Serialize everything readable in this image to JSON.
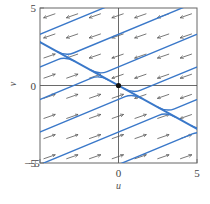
{
  "chart_data": {
    "type": "vector_field",
    "title": "",
    "xlabel": "u",
    "ylabel": "v",
    "xlim": [
      -5,
      5
    ],
    "ylim": [
      -5,
      5
    ],
    "xticks": [
      -5,
      0,
      5
    ],
    "yticks": [
      -5,
      0,
      5
    ],
    "xtick_labels": [
      "−5",
      "0",
      "5"
    ],
    "ytick_labels": [
      "−5",
      "0",
      "5"
    ],
    "grid": false,
    "fixed_point": {
      "u": 0,
      "v": 0
    },
    "separatrix": {
      "slope": -0.56,
      "points": [
        [
          -5,
          3.2
        ],
        [
          0,
          0
        ],
        [
          5,
          -2.35
        ]
      ]
    },
    "field_description": "Arrows point left (with slight down tilt) above the separatrix line and right (with slight up tilt) below it",
    "trajectory_slope": 0.42,
    "trajectory_color": "#3a78c9",
    "arrow_color": "#555555",
    "trajectories_right_of_top": [
      {
        "start": [
          -5,
          4.3
        ],
        "note": "curve from left edge near top bending to separatrix"
      },
      {
        "start": [
          -5,
          1.9
        ]
      },
      {
        "start": [
          -5,
          -0.9
        ]
      },
      {
        "start": [
          -5,
          -2.9
        ]
      },
      {
        "start": [
          -5,
          -5
        ]
      }
    ]
  },
  "axes": {
    "x_label": "u",
    "y_label": "v",
    "x_ticks": [
      "−5",
      "0",
      "5"
    ],
    "y_ticks": [
      "5",
      "0",
      "−5"
    ]
  }
}
